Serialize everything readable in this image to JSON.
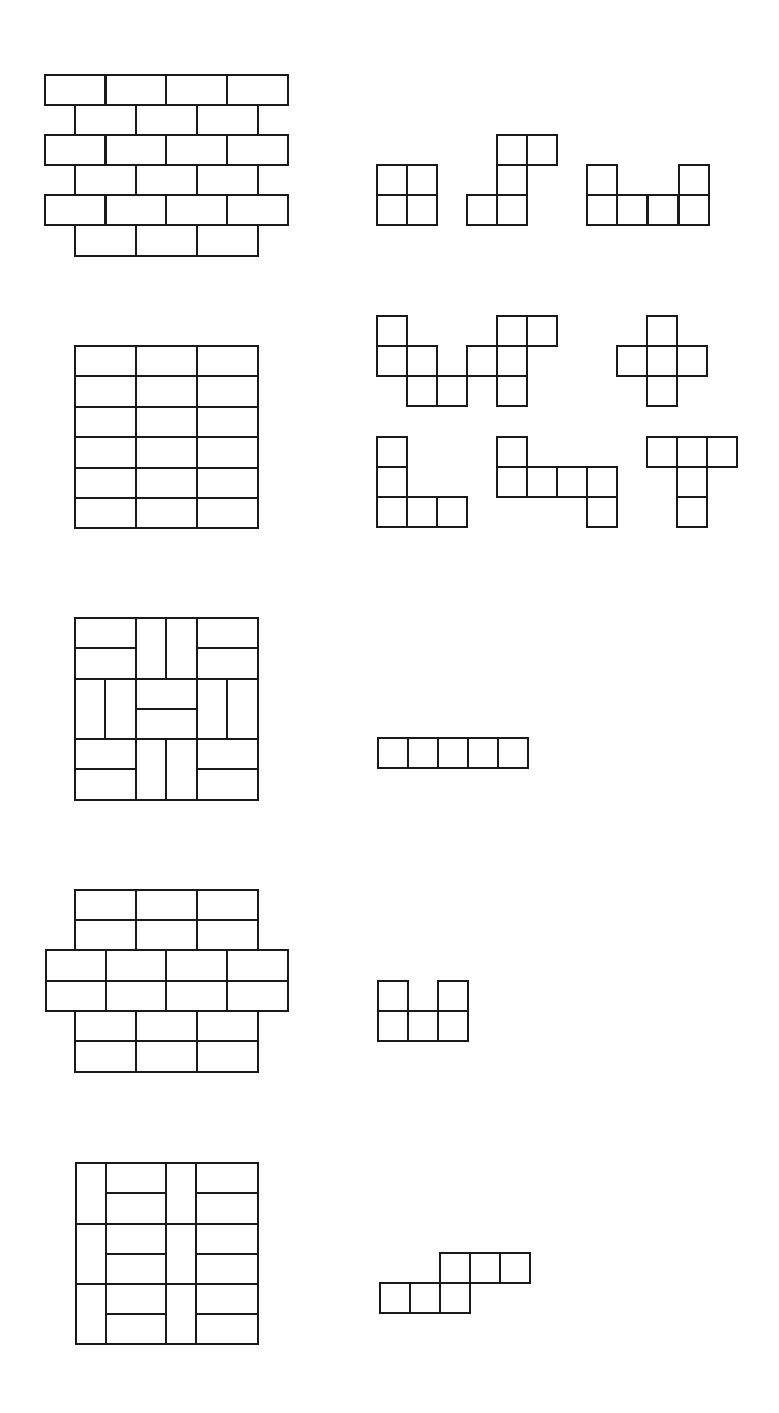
{
  "page": {
    "width": 779,
    "height": 1413,
    "background": "#ffffff",
    "stroke_color": "#1a1a1a",
    "stroke_width": 2
  },
  "figures": [
    {
      "id": "tiling-1",
      "kind": "running-bond-brick",
      "description": "Offset brick pattern: alternating rows of 4 and 3 bricks (1x2)",
      "rects": [
        [
          45,
          75,
          60,
          30
        ],
        [
          106,
          75,
          60,
          30
        ],
        [
          166,
          75,
          61,
          30
        ],
        [
          227,
          75,
          61,
          30
        ],
        [
          75,
          105,
          61,
          30
        ],
        [
          136,
          105,
          61,
          30
        ],
        [
          197,
          105,
          61,
          30
        ],
        [
          45,
          135,
          60,
          30
        ],
        [
          106,
          135,
          60,
          30
        ],
        [
          166,
          135,
          61,
          30
        ],
        [
          227,
          135,
          61,
          30
        ],
        [
          75,
          165,
          61,
          30
        ],
        [
          136,
          165,
          61,
          30
        ],
        [
          197,
          165,
          61,
          30
        ],
        [
          45,
          195,
          60,
          30
        ],
        [
          106,
          195,
          60,
          30
        ],
        [
          166,
          195,
          61,
          30
        ],
        [
          227,
          195,
          61,
          30
        ],
        [
          75,
          225,
          61,
          31
        ],
        [
          136,
          225,
          61,
          31
        ],
        [
          197,
          225,
          61,
          31
        ]
      ]
    },
    {
      "id": "tiling-2",
      "kind": "stacked-brick-grid",
      "description": "3 columns x 6 rows of horizontal bricks",
      "rects": [
        [
          75,
          346,
          61,
          30
        ],
        [
          136,
          346,
          61,
          30
        ],
        [
          197,
          346,
          61,
          30
        ],
        [
          75,
          376,
          61,
          31
        ],
        [
          136,
          376,
          61,
          31
        ],
        [
          197,
          376,
          61,
          31
        ],
        [
          75,
          407,
          61,
          30
        ],
        [
          136,
          407,
          61,
          30
        ],
        [
          197,
          407,
          61,
          30
        ],
        [
          75,
          437,
          61,
          31
        ],
        [
          136,
          437,
          61,
          31
        ],
        [
          197,
          437,
          61,
          31
        ],
        [
          75,
          468,
          61,
          30
        ],
        [
          136,
          468,
          61,
          30
        ],
        [
          197,
          468,
          61,
          30
        ],
        [
          75,
          498,
          61,
          30
        ],
        [
          136,
          498,
          61,
          30
        ],
        [
          197,
          498,
          61,
          30
        ]
      ]
    },
    {
      "id": "tiling-3",
      "kind": "basket-weave",
      "description": "3x3 blocks, each block split into two bricks, alternating horizontal/vertical",
      "rects": [
        [
          75,
          618,
          61,
          30
        ],
        [
          75,
          648,
          61,
          31
        ],
        [
          136,
          618,
          30,
          61
        ],
        [
          166,
          618,
          31,
          61
        ],
        [
          197,
          618,
          61,
          30
        ],
        [
          197,
          648,
          61,
          31
        ],
        [
          75,
          679,
          30,
          60
        ],
        [
          105,
          679,
          31,
          60
        ],
        [
          136,
          679,
          61,
          30
        ],
        [
          136,
          709,
          61,
          30
        ],
        [
          197,
          679,
          30,
          60
        ],
        [
          227,
          679,
          31,
          60
        ],
        [
          75,
          739,
          61,
          30
        ],
        [
          75,
          769,
          61,
          31
        ],
        [
          136,
          739,
          30,
          61
        ],
        [
          166,
          739,
          31,
          61
        ],
        [
          197,
          739,
          61,
          30
        ],
        [
          197,
          769,
          61,
          31
        ]
      ]
    },
    {
      "id": "tiling-4",
      "kind": "stacked-bond-cross",
      "description": "Cross-shaped pattern: 3-wide band, 4-wide band, 3-wide band of paired bricks",
      "rects": [
        [
          75,
          890,
          61,
          30
        ],
        [
          136,
          890,
          61,
          30
        ],
        [
          197,
          890,
          61,
          30
        ],
        [
          75,
          920,
          61,
          30
        ],
        [
          136,
          920,
          61,
          30
        ],
        [
          197,
          920,
          61,
          30
        ],
        [
          46,
          950,
          60,
          31
        ],
        [
          106,
          950,
          60,
          31
        ],
        [
          166,
          950,
          61,
          31
        ],
        [
          227,
          950,
          61,
          31
        ],
        [
          46,
          981,
          60,
          30
        ],
        [
          106,
          981,
          60,
          30
        ],
        [
          166,
          981,
          61,
          30
        ],
        [
          227,
          981,
          61,
          30
        ],
        [
          75,
          1011,
          61,
          30
        ],
        [
          136,
          1011,
          61,
          30
        ],
        [
          197,
          1011,
          61,
          30
        ],
        [
          75,
          1041,
          61,
          31
        ],
        [
          136,
          1041,
          61,
          31
        ],
        [
          197,
          1041,
          61,
          31
        ]
      ]
    },
    {
      "id": "tiling-5",
      "kind": "column-herringbone",
      "description": "Alternating narrow vertical-brick columns and wide stacked horizontal-brick columns",
      "rects": [
        [
          76,
          1163,
          30,
          61
        ],
        [
          106,
          1163,
          60,
          30
        ],
        [
          106,
          1193,
          60,
          31
        ],
        [
          166,
          1163,
          30,
          61
        ],
        [
          196,
          1163,
          62,
          30
        ],
        [
          196,
          1193,
          62,
          31
        ],
        [
          76,
          1224,
          30,
          60
        ],
        [
          106,
          1224,
          60,
          30
        ],
        [
          106,
          1254,
          60,
          30
        ],
        [
          166,
          1224,
          30,
          60
        ],
        [
          196,
          1224,
          62,
          30
        ],
        [
          196,
          1254,
          62,
          30
        ],
        [
          76,
          1284,
          30,
          60
        ],
        [
          106,
          1284,
          60,
          30
        ],
        [
          106,
          1314,
          60,
          30
        ],
        [
          166,
          1284,
          30,
          60
        ],
        [
          196,
          1284,
          62,
          30
        ],
        [
          196,
          1314,
          62,
          30
        ]
      ]
    }
  ],
  "polyominoes": [
    {
      "id": "O-tetromino",
      "group": 1,
      "cell": 30,
      "cells": [
        [
          377,
          165
        ],
        [
          407,
          165
        ],
        [
          377,
          195
        ],
        [
          407,
          195
        ]
      ]
    },
    {
      "id": "S-pentomino",
      "group": 1,
      "cell": 30,
      "cells": [
        [
          497,
          135
        ],
        [
          527,
          135
        ],
        [
          497,
          165
        ],
        [
          467,
          195
        ],
        [
          497,
          195
        ]
      ]
    },
    {
      "id": "U-hexomino",
      "group": 1,
      "cell": 30,
      "cells": [
        [
          587,
          165
        ],
        [
          679,
          165
        ],
        [
          587,
          195
        ],
        [
          617,
          195
        ],
        [
          648,
          195
        ],
        [
          679,
          195
        ]
      ]
    },
    {
      "id": "W-pentomino",
      "group": 2,
      "cell": 30,
      "cells": [
        [
          377,
          316
        ],
        [
          377,
          346
        ],
        [
          407,
          346
        ],
        [
          407,
          376
        ],
        [
          437,
          376
        ]
      ]
    },
    {
      "id": "F-pentomino",
      "group": 2,
      "cell": 30,
      "cells": [
        [
          497,
          316
        ],
        [
          527,
          316
        ],
        [
          467,
          346
        ],
        [
          497,
          346
        ],
        [
          497,
          376
        ]
      ]
    },
    {
      "id": "X-pentomino",
      "group": 2,
      "cell": 30,
      "cells": [
        [
          647,
          316
        ],
        [
          617,
          346
        ],
        [
          647,
          346
        ],
        [
          677,
          346
        ],
        [
          647,
          376
        ]
      ]
    },
    {
      "id": "V-pentomino",
      "group": 2,
      "cell": 30,
      "cells": [
        [
          377,
          437
        ],
        [
          377,
          467
        ],
        [
          377,
          497
        ],
        [
          407,
          497
        ],
        [
          437,
          497
        ]
      ]
    },
    {
      "id": "hexomino-hook",
      "group": 2,
      "cell": 30,
      "cells": [
        [
          497,
          437
        ],
        [
          497,
          467
        ],
        [
          527,
          467
        ],
        [
          557,
          467
        ],
        [
          587,
          467
        ],
        [
          587,
          497
        ]
      ]
    },
    {
      "id": "T-pentomino",
      "group": 2,
      "cell": 30,
      "cells": [
        [
          647,
          437
        ],
        [
          677,
          437
        ],
        [
          707,
          437
        ],
        [
          677,
          467
        ],
        [
          677,
          497
        ]
      ]
    },
    {
      "id": "I-pentomino",
      "group": 3,
      "cell": 30,
      "cells": [
        [
          378,
          738
        ],
        [
          408,
          738
        ],
        [
          438,
          738
        ],
        [
          468,
          738
        ],
        [
          498,
          738
        ]
      ]
    },
    {
      "id": "U-pentomino",
      "group": 4,
      "cell": 30,
      "cells": [
        [
          378,
          981
        ],
        [
          438,
          981
        ],
        [
          378,
          1011
        ],
        [
          408,
          1011
        ],
        [
          438,
          1011
        ]
      ]
    },
    {
      "id": "N-hexomino",
      "group": 5,
      "cell": 30,
      "cells": [
        [
          440,
          1253
        ],
        [
          470,
          1253
        ],
        [
          500,
          1253
        ],
        [
          380,
          1283
        ],
        [
          410,
          1283
        ],
        [
          440,
          1283
        ]
      ]
    }
  ]
}
